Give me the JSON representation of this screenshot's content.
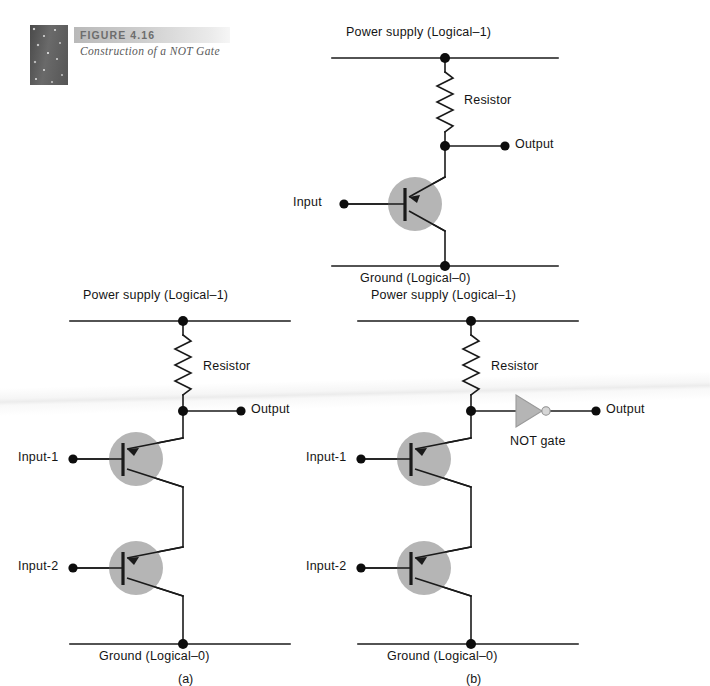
{
  "figure": {
    "number": "FIGURE 4.16",
    "caption": "Construction of a NOT Gate",
    "thumb_icon": "texture-swatch"
  },
  "diagram": {
    "type": "circuit-schematic",
    "title": "Construction of a NOT Gate",
    "panels": [
      {
        "id": "top",
        "sub_label": "",
        "description": "single-transistor NOT gate (inverter)",
        "rail_top_label": "Power supply (Logical–1)",
        "rail_bottom_label": "Ground (Logical–0)",
        "resistor_label": "Resistor",
        "output_label": "Output",
        "inputs": [
          "Input"
        ],
        "transistor_count": 1,
        "has_not_gate_symbol": false
      },
      {
        "id": "a",
        "sub_label": "(a)",
        "description": "two transistors in series, output taken directly",
        "rail_top_label": "Power supply (Logical–1)",
        "rail_bottom_label": "Ground (Logical–0)",
        "resistor_label": "Resistor",
        "output_label": "Output",
        "inputs": [
          "Input-1",
          "Input-2"
        ],
        "transistor_count": 2,
        "has_not_gate_symbol": false
      },
      {
        "id": "b",
        "sub_label": "(b)",
        "description": "two transistors in series feeding a NOT gate",
        "rail_top_label": "Power supply (Logical–1)",
        "rail_bottom_label": "Ground (Logical–0)",
        "resistor_label": "Resistor",
        "output_label": "Output",
        "not_gate_label": "NOT gate",
        "inputs": [
          "Input-1",
          "Input-2"
        ],
        "transistor_count": 2,
        "has_not_gate_symbol": true
      }
    ]
  },
  "colors": {
    "wire": "#1a1a1a",
    "transistor_fill": "#b5b5b5",
    "not_gate_fill": "#b5b5b5",
    "text": "#141414",
    "caption_text": "#5a5a5a",
    "band_light": "#ebebeb",
    "band_dark": "#b9b9b9",
    "background": "#ffffff"
  }
}
